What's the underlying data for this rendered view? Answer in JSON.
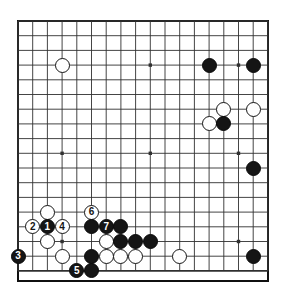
{
  "diagram": {
    "kind": "go-board-diagram",
    "board_size": 18,
    "title": "",
    "colors": {
      "background": "#ffffff",
      "board": "#ffffff",
      "line": "#303030",
      "border": "#101010",
      "black_stone": "#151515",
      "white_stone": "#ffffff",
      "black_label": "#ffffff",
      "white_label": "#151515"
    },
    "geometry": {
      "origin_x": 18,
      "origin_y": 21,
      "spacing": 14.7,
      "columns": 18,
      "rows": 18,
      "stone_diameter": 15
    },
    "star_points": [
      {
        "col": 3,
        "row": 3
      },
      {
        "col": 9,
        "row": 3
      },
      {
        "col": 15,
        "row": 3
      },
      {
        "col": 3,
        "row": 9
      },
      {
        "col": 9,
        "row": 9
      },
      {
        "col": 15,
        "row": 9
      },
      {
        "col": 3,
        "row": 15
      },
      {
        "col": 9,
        "row": 15
      },
      {
        "col": 15,
        "row": 15
      }
    ],
    "stones": [
      {
        "col": 3,
        "row": 3,
        "color": "white",
        "label": ""
      },
      {
        "col": 13,
        "row": 3,
        "color": "black",
        "label": ""
      },
      {
        "col": 16,
        "row": 3,
        "color": "black",
        "label": ""
      },
      {
        "col": 14,
        "row": 6,
        "color": "white",
        "label": ""
      },
      {
        "col": 16,
        "row": 6,
        "color": "white",
        "label": ""
      },
      {
        "col": 13,
        "row": 7,
        "color": "white",
        "label": ""
      },
      {
        "col": 14,
        "row": 7,
        "color": "black",
        "label": ""
      },
      {
        "col": 16,
        "row": 10,
        "color": "black",
        "label": ""
      },
      {
        "col": 16,
        "row": 16,
        "color": "black",
        "label": ""
      },
      {
        "col": 2,
        "row": 13,
        "color": "white",
        "label": ""
      },
      {
        "col": 5,
        "row": 13,
        "color": "white",
        "label": "6"
      },
      {
        "col": 1,
        "row": 14,
        "color": "white",
        "label": "2"
      },
      {
        "col": 2,
        "row": 14,
        "color": "black",
        "label": "1"
      },
      {
        "col": 3,
        "row": 14,
        "color": "white",
        "label": "4"
      },
      {
        "col": 5,
        "row": 14,
        "color": "black",
        "label": ""
      },
      {
        "col": 6,
        "row": 14,
        "color": "black",
        "label": "7"
      },
      {
        "col": 7,
        "row": 14,
        "color": "black",
        "label": ""
      },
      {
        "col": 2,
        "row": 15,
        "color": "white",
        "label": ""
      },
      {
        "col": 6,
        "row": 15,
        "color": "white",
        "label": ""
      },
      {
        "col": 7,
        "row": 15,
        "color": "black",
        "label": ""
      },
      {
        "col": 8,
        "row": 15,
        "color": "black",
        "label": ""
      },
      {
        "col": 9,
        "row": 15,
        "color": "black",
        "label": ""
      },
      {
        "col": 0,
        "row": 16,
        "color": "black",
        "label": "3"
      },
      {
        "col": 3,
        "row": 16,
        "color": "white",
        "label": ""
      },
      {
        "col": 5,
        "row": 16,
        "color": "black",
        "label": ""
      },
      {
        "col": 6,
        "row": 16,
        "color": "white",
        "label": ""
      },
      {
        "col": 7,
        "row": 16,
        "color": "white",
        "label": ""
      },
      {
        "col": 8,
        "row": 16,
        "color": "white",
        "label": ""
      },
      {
        "col": 11,
        "row": 16,
        "color": "white",
        "label": ""
      },
      {
        "col": 4,
        "row": 17,
        "color": "black",
        "label": "5"
      },
      {
        "col": 5,
        "row": 17,
        "color": "black",
        "label": ""
      }
    ],
    "move_sequence": [
      {
        "number": "1",
        "color": "black",
        "col": 2,
        "row": 14
      },
      {
        "number": "2",
        "color": "white",
        "col": 1,
        "row": 14
      },
      {
        "number": "3",
        "color": "black",
        "col": 0,
        "row": 16
      },
      {
        "number": "4",
        "color": "white",
        "col": 3,
        "row": 14
      },
      {
        "number": "5",
        "color": "black",
        "col": 4,
        "row": 17
      },
      {
        "number": "6",
        "color": "white",
        "col": 5,
        "row": 13
      },
      {
        "number": "7",
        "color": "black",
        "col": 6,
        "row": 14
      }
    ]
  }
}
